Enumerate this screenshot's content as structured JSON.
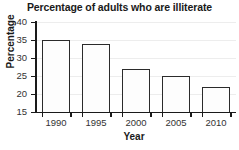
{
  "chart_data": {
    "type": "bar",
    "title": "Percentage of adults who are illiterate",
    "xlabel": "Year",
    "ylabel": "Percentage",
    "categories": [
      "1990",
      "1995",
      "2000",
      "2005",
      "2010"
    ],
    "values": [
      35,
      34,
      27,
      25,
      22
    ],
    "ylim": [
      15,
      40
    ],
    "yticks": [
      15,
      20,
      25,
      30,
      35,
      40
    ],
    "ytick_labels": [
      "15",
      "20",
      "25",
      "30",
      "35",
      "40"
    ],
    "grid": true,
    "legend": false,
    "bar_fill_color": "#fdfdfd",
    "bar_edge_color": "#2b2b2b",
    "axis_color": "#1a1a1a",
    "grid_color": "#ededed",
    "background_color": "#ffffff"
  }
}
